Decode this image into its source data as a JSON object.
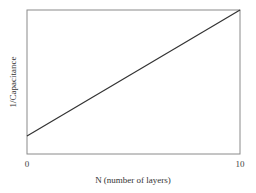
{
  "chart_data": {
    "type": "line",
    "title": "",
    "xlabel": "N (number of layers)",
    "ylabel": "1/Capacitance",
    "x_ticks": [
      "0",
      "10"
    ],
    "y_ticks": [],
    "xlim": [
      0,
      10
    ],
    "ylim": [
      0,
      1
    ],
    "grid": false,
    "legend": null,
    "series": [
      {
        "name": "1/Capacitance vs N",
        "x": [
          0,
          10
        ],
        "y": [
          0.125,
          1.0
        ]
      }
    ],
    "annotations": []
  },
  "colors": {
    "frame": "#8a8a8a",
    "line": "#333333",
    "text": "#333333"
  }
}
